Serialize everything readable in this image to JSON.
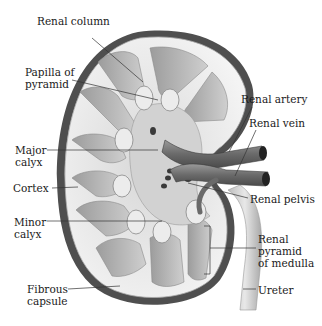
{
  "diagram": {
    "colors": {
      "background": "#ffffff",
      "capsule_dark": "#4a4a4a",
      "cortex": "#e4e4e4",
      "pyramid": "#b9b9b9",
      "calyx": "#d6d6d6",
      "vessel": "#7a7a7a",
      "label_text": "#1a1a1a",
      "leader_line": "#333333"
    },
    "labels": [
      {
        "id": "renal-column",
        "text": "Renal column",
        "x": 37,
        "y": 22
      },
      {
        "id": "papilla-of-pyramid",
        "text": "Papilla of\npyramid",
        "x": 25,
        "y": 66
      },
      {
        "id": "major-calyx",
        "text": "Major\ncalyx",
        "x": 15,
        "y": 144
      },
      {
        "id": "cortex",
        "text": "Cortex",
        "x": 13,
        "y": 181
      },
      {
        "id": "minor-calyx",
        "text": "Minor\ncalyx",
        "x": 14,
        "y": 216
      },
      {
        "id": "fibrous-capsule",
        "text": "Fibrous\ncapsule",
        "x": 27,
        "y": 283
      },
      {
        "id": "renal-artery",
        "text": "Renal artery",
        "x": 241,
        "y": 93
      },
      {
        "id": "renal-vein",
        "text": "Renal vein",
        "x": 249,
        "y": 117
      },
      {
        "id": "renal-pelvis",
        "text": "Renal pelvis",
        "x": 250,
        "y": 193
      },
      {
        "id": "renal-pyramid-of-medulla",
        "text": "Renal\npyramid\nof medulla",
        "x": 258,
        "y": 233
      },
      {
        "id": "ureter",
        "text": "Ureter",
        "x": 258,
        "y": 285
      }
    ]
  }
}
